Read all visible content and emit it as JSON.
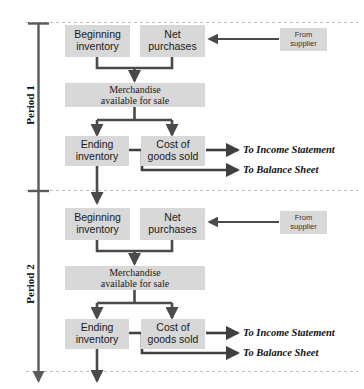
{
  "diagram": {
    "colors": {
      "box_fill": "#d8d8d8",
      "connector": "#4a4a4a",
      "divider": "#b0b0b0",
      "text": "#1a1a1a",
      "background": "#ffffff"
    },
    "periods": [
      {
        "label": "Period 1",
        "nodes": {
          "beginning_inventory": "Beginning\ninventory",
          "net_purchases": "Net\npurchases",
          "from_supplier": "From\nsupplier",
          "merchandise_available": "Merchandise\navailable for sale",
          "ending_inventory": "Ending\ninventory",
          "cost_of_goods_sold": "Cost of\ngoods sold"
        },
        "outputs": {
          "income_statement": "To Income Statement",
          "balance_sheet": "To Balance Sheet"
        }
      },
      {
        "label": "Period 2",
        "nodes": {
          "beginning_inventory": "Beginning\ninventory",
          "net_purchases": "Net\npurchases",
          "from_supplier": "From\nsupplier",
          "merchandise_available": "Merchandise\navailable for sale",
          "ending_inventory": "Ending\ninventory",
          "cost_of_goods_sold": "Cost of\ngoods sold"
        },
        "outputs": {
          "income_statement": "To Income Statement",
          "balance_sheet": "To Balance Sheet"
        }
      }
    ],
    "node_lines": {
      "beginning_inventory_l1": "Beginning",
      "beginning_inventory_l2": "inventory",
      "net_purchases_l1": "Net",
      "net_purchases_l2": "purchases",
      "from_supplier_l1": "From",
      "from_supplier_l2": "supplier",
      "merchandise_l1": "Merchandise",
      "merchandise_l2": "available for sale",
      "ending_inventory_l1": "Ending",
      "ending_inventory_l2": "inventory",
      "cogs_l1": "Cost of",
      "cogs_l2": "goods sold"
    }
  }
}
